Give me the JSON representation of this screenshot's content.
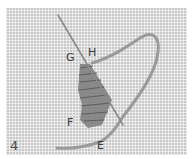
{
  "figure": {
    "step_number": "4",
    "points": {
      "G": "G",
      "H": "H",
      "F": "F",
      "E": "E"
    },
    "colors": {
      "fabric": "#c9c9c9",
      "thread": "#9a9a9a",
      "needle": "#8a8a8a",
      "stitches": "#6f6f6f",
      "labels": "#3a3a3a"
    }
  }
}
